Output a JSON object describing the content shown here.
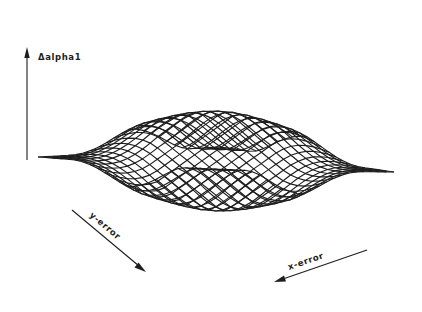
{
  "figure": {
    "type": "3d-wireframe-surface",
    "line_color": "#1e1e1e",
    "background": "#ffffff"
  },
  "axes": {
    "z": {
      "label": "Δalpha1",
      "direction": "up"
    },
    "y": {
      "label": "y-error",
      "direction": "down-right"
    },
    "x": {
      "label": "x-error",
      "direction": "down-left"
    }
  },
  "surface": {
    "grid_count": 24,
    "plateau_radius": 0.28,
    "falloff_width": 0.55,
    "shape": "raised square plateau with flat corners at zero"
  },
  "projection": {
    "top": [
      220,
      22
    ],
    "left": [
      38,
      157
    ],
    "right": [
      394,
      172
    ],
    "bottom": [
      215,
      295
    ],
    "height_px": 120
  }
}
